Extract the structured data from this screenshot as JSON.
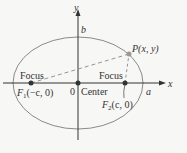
{
  "diagram": {
    "type": "ellipse-foci",
    "axes": {
      "x_label": "x",
      "y_label": "y"
    },
    "labels": {
      "b": "b",
      "a": "a",
      "origin": "0",
      "center": "Center",
      "focus_left": "Focus",
      "focus_right": "Focus",
      "f1_name": "F",
      "f1_sub": "1",
      "f1_coords": "(−c, 0)",
      "f2_name": "F",
      "f2_sub": "2",
      "f2_coords": "(c, 0)",
      "point": "P(x, y)"
    },
    "colors": {
      "ellipse": "#8a8a8a",
      "axes": "#333333",
      "dashed": "#888888",
      "point": "#999999"
    }
  }
}
